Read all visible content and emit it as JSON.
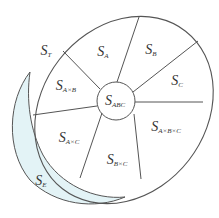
{
  "diagram": {
    "type": "segmented-ellipse-venn",
    "colors": {
      "stroke": "#555555",
      "shaded_fill": "#e3f3f6",
      "background": "#ffffff",
      "text": "#333333"
    },
    "regions": {
      "S_T": {
        "main": "S",
        "sub": "T"
      },
      "S_A": {
        "main": "S",
        "sub": "A"
      },
      "S_B": {
        "main": "S",
        "sub": "B"
      },
      "S_C": {
        "main": "S",
        "sub": "C"
      },
      "S_AxB": {
        "main": "S",
        "sub": "A×B"
      },
      "S_ABC": {
        "main": "S",
        "sub": "ABC"
      },
      "S_AxBxC": {
        "main": "S",
        "sub": "A×B×C"
      },
      "S_AxC": {
        "main": "S",
        "sub": "A×C"
      },
      "S_BxC": {
        "main": "S",
        "sub": "B×C"
      },
      "S_E": {
        "main": "S",
        "sub": "E"
      }
    }
  }
}
